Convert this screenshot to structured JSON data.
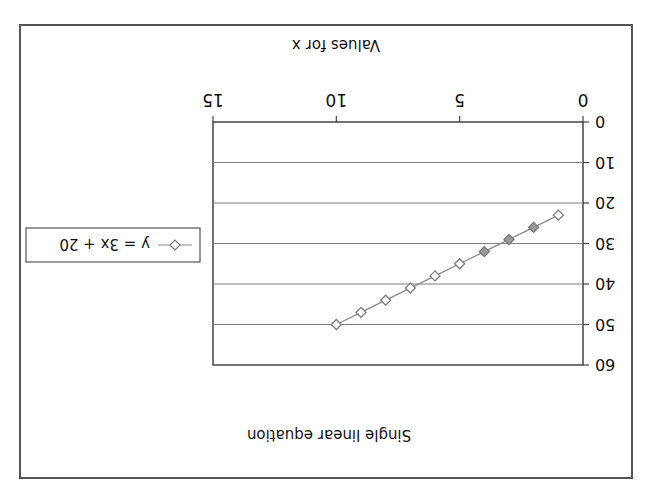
{
  "chart_data": {
    "type": "line",
    "title": "Single linear equation",
    "xlabel": "Values for x",
    "ylabel": "",
    "xlim": [
      0,
      15
    ],
    "ylim": [
      0,
      60
    ],
    "x_ticks": [
      "0",
      "5",
      "10",
      "15"
    ],
    "y_ticks": [
      "0",
      "10",
      "20",
      "30",
      "40",
      "50",
      "60"
    ],
    "grid": {
      "horizontal": true,
      "vertical": false
    },
    "legend_position": "right",
    "rotation_deg": 180,
    "series": [
      {
        "name": "y = 3x + 20",
        "marker": "diamond-open",
        "x": [
          1,
          2,
          3,
          4,
          5,
          6,
          7,
          8,
          9,
          10
        ],
        "values": [
          23,
          26,
          29,
          32,
          35,
          38,
          41,
          44,
          47,
          50
        ]
      }
    ]
  },
  "colors": {
    "line": "#8a8a8a",
    "marker": "#7a7a7a",
    "grid": "#808080",
    "border": "#555555"
  }
}
